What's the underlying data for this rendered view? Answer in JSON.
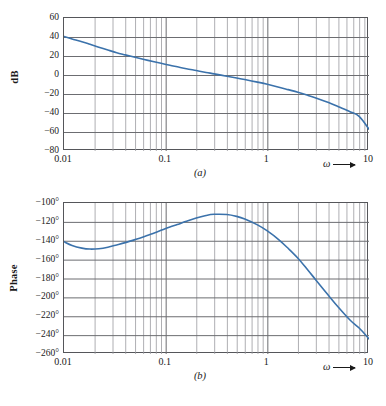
{
  "figure": {
    "panels": [
      {
        "id": "a",
        "label": "(a)",
        "ylabel": "dB",
        "xlabel": "ω",
        "yticks": [
          "60",
          "40",
          "20",
          "0",
          "−20",
          "−40",
          "−60",
          "−80"
        ],
        "xticks": [
          "0.01",
          "0.1",
          "1",
          "10"
        ]
      },
      {
        "id": "b",
        "label": "(b)",
        "ylabel": "Phase",
        "xlabel": "ω",
        "yticks": [
          "−100°",
          "−120°",
          "−140°",
          "−160°",
          "−180°",
          "−200°",
          "−220°",
          "−240°",
          "−260°"
        ],
        "xticks": [
          "0.01",
          "0.1",
          "1",
          "10"
        ]
      }
    ],
    "caption_fragment": ""
  },
  "colors": {
    "curve": "#3b72ab",
    "grid_major": "#6c6d71",
    "grid_minor": "#9a9b9f",
    "axis": "#55565a",
    "text": "#1a1a1a"
  },
  "chart_data": [
    {
      "type": "line",
      "title": "",
      "panel": "a",
      "xlabel": "ω",
      "ylabel": "dB",
      "xscale": "log",
      "xlim": [
        0.01,
        10
      ],
      "ylim": [
        -80,
        60
      ],
      "ytick_values": [
        60,
        40,
        20,
        0,
        -20,
        -40,
        -60,
        -80
      ],
      "xtick_values": [
        0.01,
        0.1,
        1,
        10
      ],
      "grid": true,
      "legend": "none",
      "series": [
        {
          "name": "magnitude",
          "x": [
            0.01,
            0.012,
            0.015,
            0.018,
            0.022,
            0.027,
            0.033,
            0.04,
            0.05,
            0.06,
            0.075,
            0.09,
            0.11,
            0.13,
            0.16,
            0.2,
            0.25,
            0.3,
            0.4,
            0.5,
            0.6,
            0.8,
            1.0,
            1.3,
            1.6,
            2.0,
            2.5,
            3.0,
            4.0,
            5.0,
            6.5,
            8.0,
            10.0
          ],
          "y": [
            40.5,
            38.0,
            35.0,
            32.3,
            29.3,
            26.3,
            23.5,
            21.2,
            18.6,
            16.6,
            14.2,
            12.3,
            10.2,
            8.6,
            6.6,
            4.7,
            2.7,
            1.2,
            -1.3,
            -3.2,
            -4.8,
            -7.5,
            -9.8,
            -12.8,
            -15.4,
            -18.2,
            -21.4,
            -24.2,
            -29.0,
            -33.4,
            -38.6,
            -43.6,
            -57.0
          ]
        }
      ]
    },
    {
      "type": "line",
      "title": "",
      "panel": "b",
      "xlabel": "ω",
      "ylabel": "Phase",
      "xscale": "log",
      "xlim": [
        0.01,
        10
      ],
      "ylim": [
        -260,
        -100
      ],
      "ytick_values": [
        -100,
        -120,
        -140,
        -160,
        -180,
        -200,
        -220,
        -240,
        -260
      ],
      "xtick_values": [
        0.01,
        0.1,
        1,
        10
      ],
      "grid": true,
      "legend": "none",
      "series": [
        {
          "name": "phase",
          "x": [
            0.01,
            0.012,
            0.015,
            0.018,
            0.022,
            0.027,
            0.033,
            0.04,
            0.05,
            0.06,
            0.075,
            0.09,
            0.11,
            0.13,
            0.16,
            0.2,
            0.25,
            0.3,
            0.4,
            0.5,
            0.6,
            0.8,
            1.0,
            1.3,
            1.6,
            2.0,
            2.5,
            3.0,
            4.0,
            5.0,
            6.5,
            8.0,
            10.0
          ],
          "y": [
            -141.0,
            -145.0,
            -147.8,
            -148.8,
            -148.4,
            -146.8,
            -144.4,
            -142.0,
            -138.8,
            -136.0,
            -132.2,
            -129.0,
            -125.5,
            -122.8,
            -119.4,
            -116.0,
            -113.2,
            -112.0,
            -112.2,
            -114.2,
            -117.0,
            -123.2,
            -129.6,
            -139.0,
            -148.0,
            -158.5,
            -171.0,
            -181.5,
            -198.0,
            -210.5,
            -224.0,
            -232.5,
            -244.0
          ]
        }
      ]
    }
  ]
}
